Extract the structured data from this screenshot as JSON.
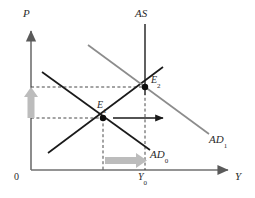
{
  "figure": {
    "kind": "economics-ad-as-diagram",
    "axes": {
      "y_axis_label": "P",
      "x_axis_label": "Y",
      "origin_label": "0"
    },
    "curves": [
      {
        "id": "as",
        "label": "AS",
        "color": "#595959",
        "type": "vertical-supply"
      },
      {
        "id": "ad0",
        "label": "AD",
        "sublabel": "0",
        "color": "#1a1a1a",
        "type": "demand-initial"
      },
      {
        "id": "ad1",
        "label": "AD",
        "sublabel": "1",
        "color": "#8c8c8c",
        "type": "demand-shifted"
      },
      {
        "id": "sras",
        "label": "",
        "color": "#1a1a1a",
        "type": "short-run-supply"
      }
    ],
    "points": [
      {
        "id": "e1",
        "label": "E",
        "sublabel": "1",
        "x": 103,
        "y": 118
      },
      {
        "id": "e2",
        "label": "E",
        "sublabel": "2",
        "x": 145,
        "y": 87
      }
    ],
    "ticks": [
      {
        "id": "y0",
        "label": "Y",
        "sublabel": "0",
        "axis": "x"
      }
    ],
    "annotations": {
      "price_rise_arrow": "upward grey arrow on P axis",
      "output_rise_arrow": "rightward grey arrow on Y axis",
      "demand_shift_arrow": "rightward dark arrow from E1"
    },
    "colors": {
      "axis": "#707070",
      "dark_curve": "#1a1a1a",
      "grey_curve": "#8c8c8c",
      "as_curve": "#595959",
      "dashed": "#333333",
      "grey_arrow": "#b8b8b8",
      "background": "#ffffff"
    }
  }
}
